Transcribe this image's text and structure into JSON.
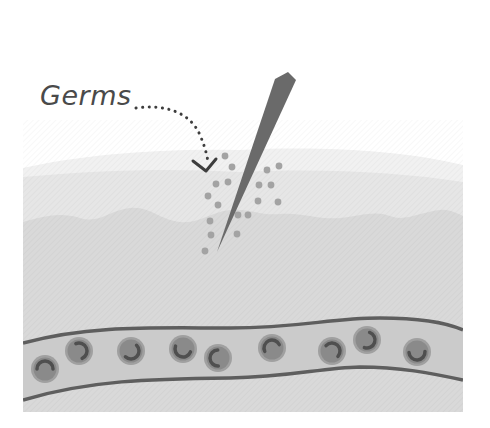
{
  "figure": {
    "label": "Germs",
    "colors": {
      "background": "#ffffff",
      "surface_layer": "#f0f0f0",
      "epidermis": "#e6e6e6",
      "dermis": "#d9d9d9",
      "vessel_fill": "#cbcbcb",
      "vessel_wall": "#5e5e5e",
      "cell_fill": "#8a8a8a",
      "cell_ring": "#a0a0a0",
      "cell_mark": "#4f4f4f",
      "needle": "#6a6a6a",
      "germ_dot": "#a3a3a3",
      "arrow": "#3d3d3d"
    },
    "parts": [
      {
        "id": "needle",
        "description": "needle piercing skin"
      },
      {
        "id": "germs",
        "description": "germ particles carried into skin"
      },
      {
        "id": "skin-layers",
        "description": "skin tissue layers"
      },
      {
        "id": "blood-vessel",
        "description": "blood vessel with blood cells"
      }
    ],
    "blood_cells": [
      {
        "cx": 45,
        "cy": 369
      },
      {
        "cx": 79,
        "cy": 351
      },
      {
        "cx": 131,
        "cy": 351
      },
      {
        "cx": 183,
        "cy": 349
      },
      {
        "cx": 218,
        "cy": 358
      },
      {
        "cx": 272,
        "cy": 348
      },
      {
        "cx": 332,
        "cy": 351
      },
      {
        "cx": 367,
        "cy": 340
      },
      {
        "cx": 417,
        "cy": 352
      }
    ],
    "germ_dots": [
      {
        "cx": 225,
        "cy": 156
      },
      {
        "cx": 232,
        "cy": 167
      },
      {
        "cx": 216,
        "cy": 184
      },
      {
        "cx": 228,
        "cy": 182
      },
      {
        "cx": 208,
        "cy": 196
      },
      {
        "cx": 218,
        "cy": 205
      },
      {
        "cx": 210,
        "cy": 221
      },
      {
        "cx": 211,
        "cy": 235
      },
      {
        "cx": 205,
        "cy": 251
      },
      {
        "cx": 238,
        "cy": 215
      },
      {
        "cx": 237,
        "cy": 234
      },
      {
        "cx": 267,
        "cy": 170
      },
      {
        "cx": 279,
        "cy": 166
      },
      {
        "cx": 259,
        "cy": 185
      },
      {
        "cx": 271,
        "cy": 185
      },
      {
        "cx": 258,
        "cy": 201
      },
      {
        "cx": 278,
        "cy": 202
      },
      {
        "cx": 248,
        "cy": 215
      }
    ]
  }
}
